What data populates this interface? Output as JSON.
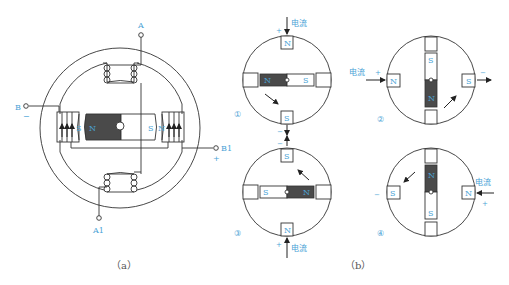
{
  "figure_a": {
    "caption": "（a）",
    "terminals": {
      "A": "A",
      "A1": "A1",
      "B": "B",
      "B1": "B1",
      "B_sign": "−",
      "B1_sign": "+"
    },
    "rotor": {
      "left_pole": "N",
      "right_pole": "S"
    },
    "stator_poles": {
      "left": "S",
      "right": "N"
    }
  },
  "figure_b": {
    "caption": "（b）",
    "current_label": "电流",
    "steps": [
      {
        "num": "①",
        "top": "N",
        "bottom": "S",
        "rotor_dark": "N",
        "rotor_light": "S",
        "top_sign": "+",
        "bottom_sign": "−"
      },
      {
        "num": "②",
        "left": "N",
        "right": "S",
        "rotor_dark": "N",
        "rotor_light": "S",
        "left_sign": "+",
        "right_sign": "−"
      },
      {
        "num": "③",
        "top": "S",
        "bottom": "N",
        "rotor_dark": "N",
        "rotor_light": "S",
        "top_sign": "−",
        "bottom_sign": "+"
      },
      {
        "num": "④",
        "left": "S",
        "right": "N",
        "rotor_dark": "N",
        "rotor_light": "S",
        "left_sign": "−",
        "right_sign": "+"
      }
    ]
  },
  "colors": {
    "label": "#4aa3d6",
    "rotor_dark": "#4a4a4a",
    "line": "#333333"
  }
}
